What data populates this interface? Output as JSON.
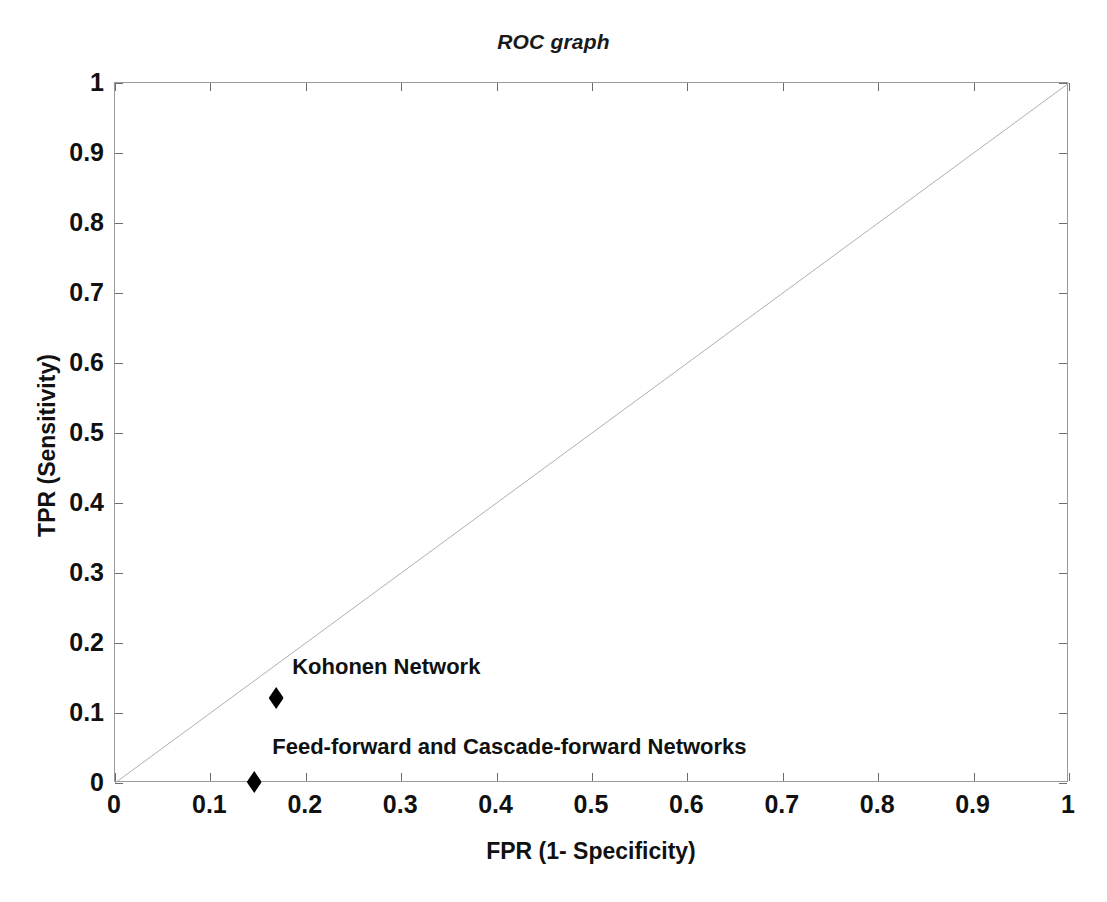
{
  "chart_data": {
    "type": "scatter",
    "title": "ROC graph",
    "xlabel": "FPR (1- Specificity)",
    "ylabel": "TPR (Sensitivity)",
    "xlim": [
      0,
      1
    ],
    "ylim": [
      0,
      1
    ],
    "grid": false,
    "legend_position": "none",
    "xticks": [
      "0",
      "0.1",
      "0.2",
      "0.3",
      "0.4",
      "0.5",
      "0.6",
      "0.7",
      "0.8",
      "0.9",
      "1"
    ],
    "xtick_values": [
      0,
      0.1,
      0.2,
      0.3,
      0.4,
      0.5,
      0.6,
      0.7,
      0.8,
      0.9,
      1
    ],
    "yticks": [
      "0",
      "0.1",
      "0.2",
      "0.3",
      "0.4",
      "0.5",
      "0.6",
      "0.7",
      "0.8",
      "0.9",
      "1"
    ],
    "ytick_values": [
      0,
      0.1,
      0.2,
      0.3,
      0.4,
      0.5,
      0.6,
      0.7,
      0.8,
      0.9,
      1
    ],
    "points": [
      {
        "label": "Kohonen Network",
        "x": 0.17,
        "y": 0.12,
        "marker": "diamond",
        "color": "#000000",
        "label_dx": 16,
        "label_dy": -18
      },
      {
        "label": "Feed-forward and Cascade-forward Networks",
        "x": 0.147,
        "y": 0.0,
        "marker": "diamond",
        "color": "#000000",
        "label_dx": 18,
        "label_dy": -22
      }
    ],
    "reference_line": {
      "name": "chance-diagonal",
      "from": [
        0,
        0
      ],
      "to": [
        1,
        1
      ],
      "color": "#b0b0b0",
      "width": 1
    },
    "axis_color": "#9a9a9a",
    "tick_color": "#6e6e6e",
    "text_color": "#111111",
    "background": "#ffffff"
  }
}
